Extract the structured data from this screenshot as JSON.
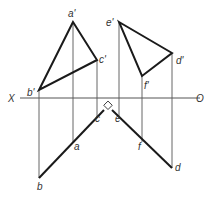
{
  "diagram": {
    "type": "orthographic-projection",
    "axis": {
      "left_label": "X",
      "right_label": "O",
      "y": 98,
      "x1": 20,
      "x2": 200
    },
    "colors": {
      "line": "#1a1a1a",
      "thin": "#555555",
      "text": "#333333"
    },
    "upper_triangles": [
      {
        "name": "triangle-abc-front",
        "points": [
          "a'",
          "b'",
          "c'"
        ]
      },
      {
        "name": "triangle-def-front",
        "points": [
          "e'",
          "d'",
          "f'"
        ]
      }
    ],
    "points": {
      "a_prime": {
        "label": "a'",
        "x": 73,
        "y": 22
      },
      "b_prime": {
        "label": "b'",
        "x": 39,
        "y": 90
      },
      "c_prime": {
        "label": "c'",
        "x": 97,
        "y": 60
      },
      "e_prime": {
        "label": "e'",
        "x": 119,
        "y": 22
      },
      "d_prime": {
        "label": "d'",
        "x": 172,
        "y": 53
      },
      "f_prime": {
        "label": "f'",
        "x": 142,
        "y": 76
      },
      "b": {
        "label": "b",
        "x": 39,
        "y": 178
      },
      "a": {
        "label": "a",
        "x": 73,
        "y": 142
      },
      "c": {
        "label": "c",
        "x": 97,
        "y": 118
      },
      "e": {
        "label": "e",
        "x": 117,
        "y": 118
      },
      "f": {
        "label": "f",
        "x": 142,
        "y": 142
      },
      "d": {
        "label": "d",
        "x": 172,
        "y": 168
      }
    },
    "right_angle_marker": {
      "x": 108,
      "y": 106
    }
  }
}
